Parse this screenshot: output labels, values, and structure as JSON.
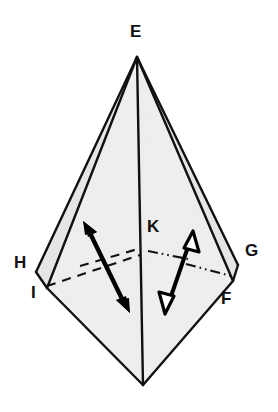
{
  "figure": {
    "kind": "geometry-diagram",
    "canvas": {
      "width": 278,
      "height": 412
    },
    "colors": {
      "background": "#ffffff",
      "stroke": "#111111",
      "face_fill": "#f1f1f1",
      "face_fill_dark": "#e6e6e6",
      "label": "#111111",
      "arrow": "#000000"
    },
    "labels": [
      {
        "id": "E",
        "text": "E",
        "x": 137,
        "y": 23,
        "anchor": "middle"
      },
      {
        "id": "H",
        "text": "H",
        "x": 18,
        "y": 255,
        "anchor": "start"
      },
      {
        "id": "I",
        "text": "I",
        "x": 33,
        "y": 286,
        "anchor": "start"
      },
      {
        "id": "K",
        "text": "K",
        "x": 148,
        "y": 219,
        "anchor": "start"
      },
      {
        "id": "G",
        "text": "G",
        "x": 246,
        "y": 243,
        "anchor": "start"
      },
      {
        "id": "F",
        "text": "F",
        "x": 221,
        "y": 292,
        "anchor": "start"
      }
    ],
    "vertices": [
      {
        "id": "E",
        "x": 137,
        "y": 57
      },
      {
        "id": "H",
        "x": 36,
        "y": 272
      },
      {
        "id": "I",
        "x": 47,
        "y": 288
      },
      {
        "id": "K",
        "x": 143,
        "y": 252
      },
      {
        "id": "G",
        "x": 238,
        "y": 265
      },
      {
        "id": "F",
        "x": 233,
        "y": 281
      },
      {
        "id": "J",
        "x": 143,
        "y": 385
      }
    ],
    "solid_edges": [
      {
        "from": "E",
        "to": "H"
      },
      {
        "from": "E",
        "to": "I"
      },
      {
        "from": "E",
        "to": "G"
      },
      {
        "from": "E",
        "to": "F"
      },
      {
        "from": "E",
        "to": "J"
      },
      {
        "from": "H",
        "to": "I"
      },
      {
        "from": "G",
        "to": "F"
      },
      {
        "from": "I",
        "to": "J"
      },
      {
        "from": "F",
        "to": "J"
      },
      {
        "from": "I",
        "to": "K"
      },
      {
        "from": "F",
        "to": "K"
      }
    ],
    "hidden_edges": [
      {
        "from": "I",
        "to": "K",
        "style": "dashed"
      },
      {
        "from": "H",
        "to": "K",
        "style": "dashed"
      },
      {
        "from": "K",
        "to": "G",
        "style": "dash-dot-dot"
      },
      {
        "from": "K",
        "to": "F",
        "style": "dash-dot-dot"
      }
    ],
    "arrows": [
      {
        "id": "left-double-arrow",
        "head_style": "filled",
        "from": {
          "x": 128,
          "y": 312
        },
        "to": {
          "x": 83,
          "y": 221
        },
        "double_headed": true
      },
      {
        "id": "right-double-arrow",
        "head_style": "hollow",
        "from": {
          "x": 165,
          "y": 313
        },
        "to": {
          "x": 193,
          "y": 231
        },
        "double_headed": true
      }
    ]
  }
}
